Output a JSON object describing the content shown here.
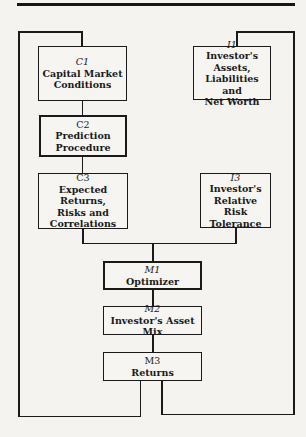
{
  "diagram": {
    "nodes": [
      {
        "id": "C1",
        "code": "C1",
        "label": "Capital Market\nConditions",
        "thick": false
      },
      {
        "id": "C2",
        "code": "C2",
        "label": "Prediction\nProcedure",
        "thick": true
      },
      {
        "id": "C3",
        "code": "C3",
        "label": "Expected Returns,\nRisks and\nCorrelations",
        "thick": false
      },
      {
        "id": "I1",
        "code": "I1",
        "label": "Investor's Assets,\nLiabilities and\nNet Worth",
        "thick": false
      },
      {
        "id": "I3",
        "code": "I3",
        "label": "Investor's\nRelative Risk\nTolerance",
        "thick": false
      },
      {
        "id": "M1",
        "code": "M1",
        "label": "Optimizer",
        "thick": true
      },
      {
        "id": "M2",
        "code": "M2",
        "label": "Investor's Asset Mix",
        "thick": false
      },
      {
        "id": "M3",
        "code": "M3",
        "label": "Returns",
        "thick": false
      }
    ],
    "edges": [
      {
        "from": "C1",
        "to": "C2"
      },
      {
        "from": "C2",
        "to": "C3"
      },
      {
        "from": "C3",
        "to": "M1"
      },
      {
        "from": "I3",
        "to": "M1"
      },
      {
        "from": "M1",
        "to": "M2"
      },
      {
        "from": "M2",
        "to": "M3"
      },
      {
        "from": "M3",
        "to": "C1",
        "type": "feedback-loop-left"
      },
      {
        "from": "M3",
        "to": "I1",
        "type": "feedback-loop-right"
      }
    ]
  }
}
